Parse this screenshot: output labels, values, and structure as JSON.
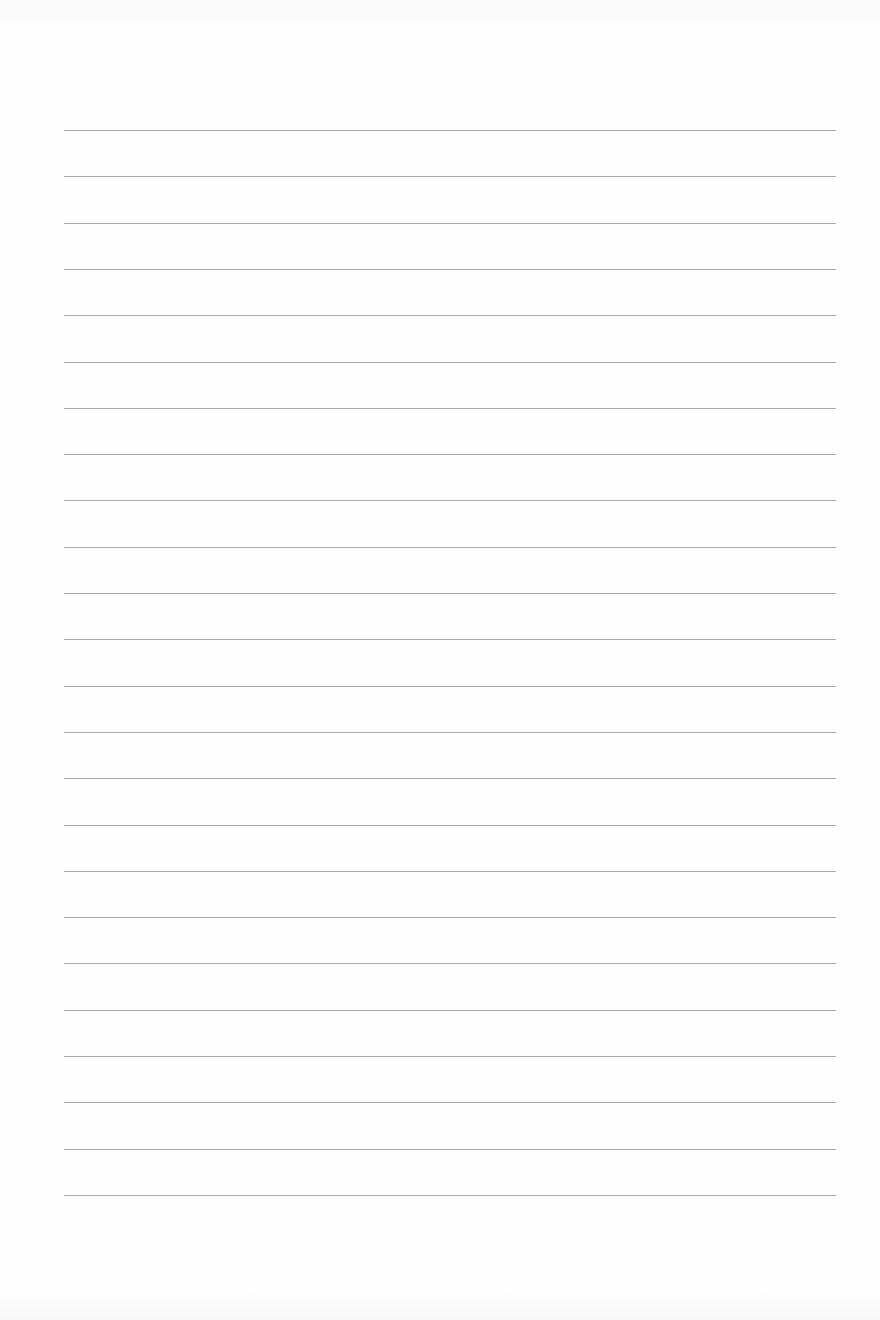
{
  "page": {
    "type": "lined-paper",
    "background_color": "#fdfdfd",
    "line_color": "#9c9c9c",
    "line_count": 24,
    "first_line_y": 130,
    "line_spacing": 46.3,
    "line_left": 64,
    "line_right": 836
  }
}
